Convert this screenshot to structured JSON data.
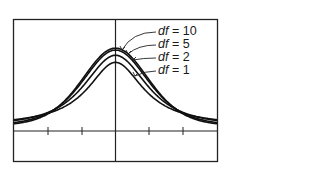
{
  "chart_data": {
    "type": "line",
    "title": "",
    "xlabel": "",
    "ylabel": "",
    "xlim": [
      -3,
      3
    ],
    "x_ticks": [
      -2,
      -1,
      0,
      1,
      2
    ],
    "tick_labels_shown": false,
    "grid": false,
    "legend_position": "upper-right (annotated with arrows)",
    "series": [
      {
        "name": "df = 10",
        "df": 10,
        "peak_density": 0.389
      },
      {
        "name": "df = 5",
        "df": 5,
        "peak_density": 0.38
      },
      {
        "name": "df = 2",
        "df": 2,
        "peak_density": 0.354
      },
      {
        "name": "df = 1",
        "df": 1,
        "peak_density": 0.318
      }
    ]
  },
  "legend": {
    "items": [
      {
        "prefix": "df",
        "text": " = 10"
      },
      {
        "prefix": "df",
        "text": " = 5"
      },
      {
        "prefix": "df",
        "text": " = 2"
      },
      {
        "prefix": "df",
        "text": " = 1"
      }
    ]
  }
}
